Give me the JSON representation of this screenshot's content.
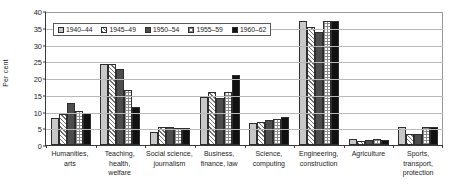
{
  "chart_data": {
    "type": "bar",
    "title": "",
    "subtitle": "",
    "xlabel": "",
    "ylabel": "Per cent",
    "ylim": [
      0,
      40
    ],
    "yticks": [
      0,
      5,
      10,
      15,
      20,
      25,
      30,
      35,
      40
    ],
    "grid": true,
    "legend_position": "top-left-inside",
    "categories": [
      "Humanities, arts",
      "Teaching, health, welfare",
      "Social science, journalism",
      "Business, finance, law",
      "Science, computing",
      "Engineering, construction",
      "Agriculture",
      "Sports, transport, protection"
    ],
    "category_lines": [
      [
        "Humanities,",
        "arts"
      ],
      [
        "Teaching,",
        "health,",
        "welfare"
      ],
      [
        "Social science,",
        "journalism"
      ],
      [
        "Business,",
        "finance, law"
      ],
      [
        "Science,",
        "computing"
      ],
      [
        "Engineering,",
        "construction"
      ],
      [
        "Agriculture"
      ],
      [
        "Sports,",
        "transport,",
        "protection"
      ]
    ],
    "series": [
      {
        "name": "1940–44",
        "pattern": "light-gray-solid",
        "color": "#c8c8c8",
        "values": [
          8.2,
          24.1,
          4.0,
          14.3,
          6.6,
          37.0,
          1.7,
          5.3
        ]
      },
      {
        "name": "1945–49",
        "pattern": "diagonal-hatch",
        "color": "#ffffff",
        "values": [
          9.3,
          24.1,
          5.3,
          15.9,
          6.8,
          35.2,
          1.3,
          3.2
        ]
      },
      {
        "name": "1950–54",
        "pattern": "dark-gray-solid",
        "color": "#4d4d4d",
        "values": [
          12.6,
          22.6,
          5.3,
          14.1,
          7.4,
          33.6,
          1.5,
          3.2
        ]
      },
      {
        "name": "1955–59",
        "pattern": "checkered",
        "color": "#ffffff",
        "values": [
          10.3,
          16.5,
          5.0,
          15.9,
          7.7,
          36.9,
          1.7,
          5.3
        ]
      },
      {
        "name": "1960–62",
        "pattern": "black-solid",
        "color": "#111111",
        "values": [
          9.5,
          11.2,
          5.0,
          21.0,
          8.3,
          36.9,
          1.6,
          5.5
        ]
      }
    ]
  }
}
